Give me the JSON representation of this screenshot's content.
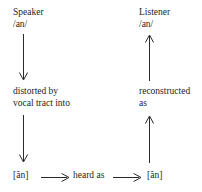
{
  "diagram": {
    "speaker": {
      "role_label": "Speaker",
      "phonemic": "/an/",
      "process_line1": "distorted by",
      "process_line2": "vocal tract into",
      "phonetic": "[ãn]"
    },
    "listener": {
      "role_label": "Listener",
      "phonemic": "/an/",
      "process_line1": "reconstructed",
      "process_line2": "as",
      "phonetic": "[ãn]"
    },
    "transmission": {
      "label": "heard as"
    },
    "arrows": [
      {
        "name": "speaker-to-distortion",
        "direction": "down"
      },
      {
        "name": "distortion-to-phonetic",
        "direction": "down"
      },
      {
        "name": "phonetic-to-reconstruction",
        "direction": "up"
      },
      {
        "name": "reconstruction-to-listener",
        "direction": "up"
      },
      {
        "name": "heard-as-left",
        "direction": "right"
      },
      {
        "name": "heard-as-right",
        "direction": "right"
      }
    ],
    "colors": {
      "background": "#ffffff",
      "text": "#1d1d1d",
      "arrow": "#2a2a2a"
    }
  }
}
